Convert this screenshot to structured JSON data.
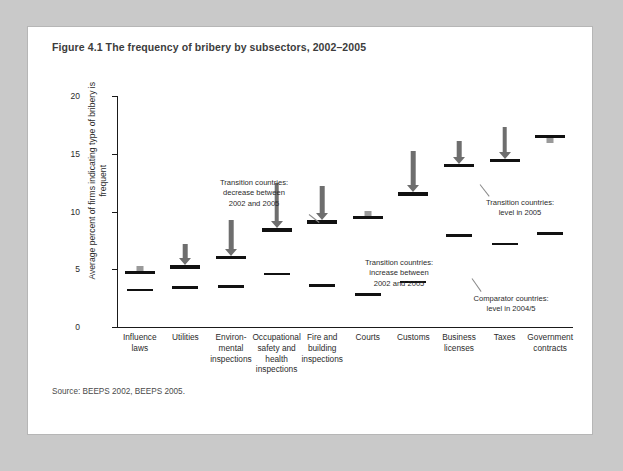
{
  "figure": {
    "title": "Figure 4.1  The frequency of bribery by subsectors, 2002–2005",
    "source": "Source: BEEPS 2002, BEEPS 2005."
  },
  "chart_data": {
    "type": "scatter",
    "title": "Figure 4.1  The frequency of bribery by subsectors, 2002–2005",
    "xlabel": "",
    "ylabel": "Average percent of firms indicating type of bribery is frequent",
    "ylim": [
      0,
      20
    ],
    "yticks": [
      0,
      5,
      10,
      15,
      20
    ],
    "ytick_labels": [
      "0",
      "5",
      "10",
      "15",
      "20"
    ],
    "grid": false,
    "legend_position": "inline-annotations",
    "categories": [
      "Influence laws",
      "Environmental inspections",
      "Utilities",
      "Occupational safety and health inspections",
      "Fire and building inspections",
      "Courts",
      "Customs",
      "Business licenses",
      "Taxes",
      "Government contracts"
    ],
    "category_labels": [
      "Influence\nlaws",
      "Utilities",
      "Environ-\nmental\ninspections",
      "Occupational\nsafety and\nhealth\ninspections",
      "Fire and\nbuilding\ninspections",
      "Courts",
      "Customs",
      "Business\nlicenses",
      "Taxes",
      "Government\ncontracts"
    ],
    "series": [
      {
        "name": "Transition countries: level in 2005",
        "marker": "thick-black-bar",
        "values": [
          4.7,
          5.2,
          6.0,
          8.4,
          9.1,
          9.5,
          11.5,
          14.0,
          14.4,
          16.5
        ]
      },
      {
        "name": "Comparator countries: level in 2004/5",
        "marker": "thin-black-bar",
        "values": [
          3.2,
          3.4,
          3.5,
          4.6,
          3.6,
          2.8,
          3.9,
          7.9,
          7.2,
          8.1
        ]
      },
      {
        "name": "Transition countries: level in 2002",
        "marker": "arrow-origin",
        "values": [
          5.2,
          7.2,
          9.3,
          12.5,
          12.2,
          8.8,
          15.2,
          16.1,
          17.3,
          16.0
        ]
      }
    ],
    "change_direction": [
      "increase",
      "decrease",
      "decrease",
      "decrease",
      "decrease",
      "increase",
      "decrease",
      "decrease",
      "decrease",
      "decrease"
    ]
  },
  "annotations": [
    {
      "id": "decrease-note",
      "text": "Transition countries:\ndecrease between\n2002 and 2005"
    },
    {
      "id": "increase-note",
      "text": "Transition countries:\nincrease between\n2002 and 2005"
    },
    {
      "id": "transition-level-note",
      "text": "Transition countries:\nlevel in 2005"
    },
    {
      "id": "comparator-level-note",
      "text": "Comparator countries:\nlevel in 2004/5"
    }
  ],
  "colors": {
    "page_background": "#c9c9c9",
    "figure_background": "#ffffff",
    "marker_black": "#111111",
    "arrow_gray": "#6e6e6e",
    "arrow_light_gray": "#9b9b9b",
    "text": "#2b2b2b"
  }
}
